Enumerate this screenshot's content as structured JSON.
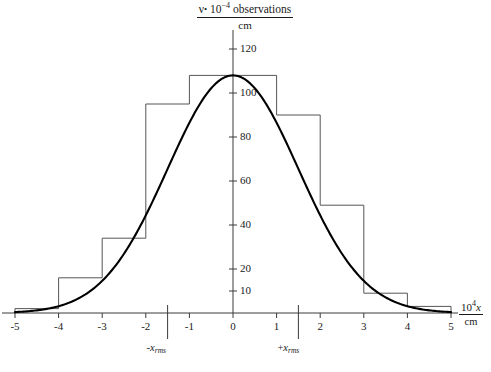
{
  "figure": {
    "type": "scientific-plot",
    "background": "#ffffff",
    "axis_color": "#3a3a3a",
    "curve_color": "#000000",
    "histogram_color": "#555555"
  },
  "yaxis_title": {
    "numerator_prefix": "ν",
    "numerator_dot": "•",
    "numerator_base": "10",
    "numerator_exponent": "−4",
    "numerator_word": "observations",
    "denominator": "cm"
  },
  "xaxis_title": {
    "numerator_base": "10",
    "numerator_exponent": "4",
    "numerator_var": "x",
    "denominator": "cm"
  },
  "annotations": [
    {
      "id": "minus-x-rms",
      "sign": "-",
      "var": "x",
      "sub": "rms",
      "x_value": -1.5
    },
    {
      "id": "plus-x-rms",
      "sign": "+",
      "var": "x",
      "sub": "rms",
      "x_value": 1.5
    }
  ],
  "chart_data": {
    "type": "bar",
    "xlabel": "10⁴ x / cm",
    "ylabel": "ν • 10⁻⁴ observations / cm",
    "xlim": [
      -5,
      5
    ],
    "ylim": [
      0,
      126
    ],
    "grid": false,
    "legend": null,
    "xticks": [
      -5,
      -4,
      -3,
      -2,
      -1,
      0,
      1,
      2,
      3,
      4,
      5
    ],
    "xtick_labels": [
      "-5",
      "-4",
      "-3",
      "-2",
      "-1",
      "0",
      "1",
      "2",
      "3",
      "4",
      "5"
    ],
    "yticks": [
      10,
      20,
      40,
      60,
      80,
      100,
      120
    ],
    "ytick_labels": [
      "10",
      "20",
      "40",
      "60",
      "80",
      "100",
      "120"
    ],
    "special_xticks": [
      -1.5,
      1.5
    ],
    "bin_width": 1,
    "bin_edges": [
      -5,
      -4,
      -3,
      -2,
      -1,
      0,
      1,
      2,
      3,
      4,
      5
    ],
    "categories": [
      "-4.5",
      "-3.5",
      "-2.5",
      "-1.5",
      "-0.5",
      "0.5",
      "1.5",
      "2.5",
      "3.5",
      "4.5"
    ],
    "values": [
      2,
      16,
      34,
      95,
      108,
      108,
      90,
      49,
      9,
      3
    ],
    "series": [
      {
        "name": "observed histogram",
        "type": "step",
        "values": [
          2,
          16,
          34,
          95,
          108,
          108,
          90,
          49,
          9,
          3
        ]
      },
      {
        "name": "gaussian fit",
        "type": "line",
        "amplitude": 108,
        "mean": 0,
        "sigma": 1.5,
        "x": [
          -5,
          -4.5,
          -4,
          -3.5,
          -3,
          -2.5,
          -2,
          -1.5,
          -1,
          -0.5,
          0,
          0.5,
          1,
          1.5,
          2,
          2.5,
          3,
          3.5,
          4,
          4.5,
          5
        ],
        "y": [
          1,
          2,
          4,
          7,
          14,
          26,
          44,
          65,
          87,
          102,
          108,
          102,
          87,
          65,
          44,
          26,
          14,
          7,
          4,
          2,
          1
        ]
      }
    ]
  }
}
